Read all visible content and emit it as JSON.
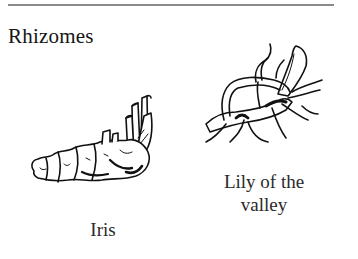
{
  "page": {
    "heading": "Rhizomes"
  },
  "figures": [
    {
      "id": "iris",
      "label": "Iris",
      "icon": "iris-rhizome-drawing"
    },
    {
      "id": "lily",
      "label_line1": "Lily of the",
      "label_line2": "valley",
      "icon": "lily-of-the-valley-rhizome-drawing"
    }
  ]
}
